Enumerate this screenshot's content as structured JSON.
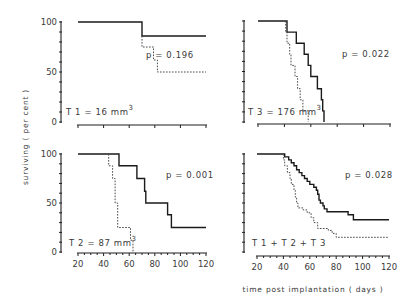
{
  "figure": {
    "ylabel": "surviving ( per cent )",
    "xlabel": "time post implantation  ( days )",
    "x_ticks": [
      "20",
      "40",
      "60",
      "80",
      "100",
      "120"
    ],
    "y_ticks": [
      "0",
      "50",
      "100"
    ]
  },
  "panels": [
    {
      "id": "t1",
      "label": "T 1 = 16 mm",
      "label_sup": "3",
      "p_value": "p = 0.196"
    },
    {
      "id": "t3",
      "label": "T 3 = 176  mm",
      "label_sup": "3",
      "p_value": "p = 0.022"
    },
    {
      "id": "t2",
      "label": "T 2 = 87 mm",
      "label_sup": "3",
      "p_value": "p = 0.001"
    },
    {
      "id": "all",
      "label": "T 1 + T 2 + T 3",
      "label_sup": "",
      "p_value": "p = 0.028"
    }
  ],
  "chart_data": [
    {
      "type": "line",
      "title": "T 1 = 16 mm3",
      "xlabel": "time post implantation (days)",
      "ylabel": "surviving (per cent)",
      "xlim": [
        20,
        120
      ],
      "ylim": [
        0,
        100
      ],
      "x_ticks": [
        20,
        40,
        60,
        80,
        100,
        120
      ],
      "y_ticks": [
        0,
        50,
        100
      ],
      "step": true,
      "annotation": "p = 0.196",
      "series": [
        {
          "name": "solid",
          "style": "solid",
          "points": [
            [
              20,
              100
            ],
            [
              70,
              100
            ],
            [
              70,
              86
            ],
            [
              120,
              86
            ]
          ]
        },
        {
          "name": "dashed",
          "style": "dashed",
          "points": [
            [
              70,
              86
            ],
            [
              70,
              75
            ],
            [
              79,
              75
            ],
            [
              79,
              62
            ],
            [
              82,
              62
            ],
            [
              82,
              50
            ],
            [
              120,
              50
            ]
          ]
        }
      ]
    },
    {
      "type": "line",
      "title": "T 3 = 176 mm3",
      "xlabel": "time post implantation (days)",
      "ylabel": "surviving (per cent)",
      "xlim": [
        20,
        120
      ],
      "ylim": [
        0,
        100
      ],
      "x_ticks": [
        20,
        40,
        60,
        80,
        100,
        120
      ],
      "y_ticks": [
        0,
        50,
        100
      ],
      "step": true,
      "annotation": "p = 0.022",
      "series": [
        {
          "name": "solid",
          "style": "solid",
          "points": [
            [
              20,
              100
            ],
            [
              42,
              100
            ],
            [
              42,
              89
            ],
            [
              49,
              89
            ],
            [
              49,
              78
            ],
            [
              55,
              78
            ],
            [
              55,
              67
            ],
            [
              58,
              67
            ],
            [
              58,
              56
            ],
            [
              60,
              56
            ],
            [
              60,
              45
            ],
            [
              65,
              45
            ],
            [
              65,
              33
            ],
            [
              68,
              33
            ],
            [
              68,
              22
            ],
            [
              69,
              22
            ],
            [
              69,
              11
            ],
            [
              70,
              11
            ],
            [
              70,
              0
            ]
          ]
        },
        {
          "name": "dashed",
          "style": "dashed",
          "points": [
            [
              41,
              100
            ],
            [
              41,
              89
            ],
            [
              42,
              89
            ],
            [
              42,
              78
            ],
            [
              44,
              78
            ],
            [
              44,
              67
            ],
            [
              45,
              67
            ],
            [
              45,
              56
            ],
            [
              48,
              56
            ],
            [
              48,
              45
            ],
            [
              50,
              45
            ],
            [
              50,
              33
            ],
            [
              52,
              33
            ],
            [
              52,
              22
            ],
            [
              54,
              22
            ],
            [
              54,
              11
            ],
            [
              58,
              11
            ],
            [
              58,
              0
            ]
          ]
        }
      ]
    },
    {
      "type": "line",
      "title": "T 2 = 87 mm3",
      "xlabel": "time post implantation (days)",
      "ylabel": "surviving (per cent)",
      "xlim": [
        20,
        120
      ],
      "ylim": [
        0,
        100
      ],
      "x_ticks": [
        20,
        40,
        60,
        80,
        100,
        120
      ],
      "y_ticks": [
        0,
        50,
        100
      ],
      "step": true,
      "annotation": "p = 0.001",
      "series": [
        {
          "name": "solid",
          "style": "solid",
          "points": [
            [
              20,
              100
            ],
            [
              52,
              100
            ],
            [
              52,
              88
            ],
            [
              66,
              88
            ],
            [
              66,
              75
            ],
            [
              72,
              75
            ],
            [
              72,
              62
            ],
            [
              73,
              62
            ],
            [
              73,
              50
            ],
            [
              90,
              50
            ],
            [
              90,
              38
            ],
            [
              93,
              38
            ],
            [
              93,
              25
            ],
            [
              120,
              25
            ]
          ]
        },
        {
          "name": "dashed",
          "style": "dashed",
          "points": [
            [
              44,
              100
            ],
            [
              44,
              88
            ],
            [
              47,
              88
            ],
            [
              47,
              75
            ],
            [
              49,
              75
            ],
            [
              49,
              50
            ],
            [
              51,
              50
            ],
            [
              51,
              25
            ],
            [
              61,
              25
            ],
            [
              61,
              12
            ],
            [
              63,
              12
            ],
            [
              63,
              0
            ]
          ]
        }
      ]
    },
    {
      "type": "line",
      "title": "T 1 + T 2 + T 3",
      "xlabel": "time post implantation (days)",
      "ylabel": "surviving (per cent)",
      "xlim": [
        20,
        120
      ],
      "ylim": [
        0,
        100
      ],
      "x_ticks": [
        20,
        40,
        60,
        80,
        100,
        120
      ],
      "y_ticks": [
        0,
        50,
        100
      ],
      "step": true,
      "annotation": "p = 0.028",
      "series": [
        {
          "name": "solid",
          "style": "solid",
          "points": [
            [
              20,
              100
            ],
            [
              41,
              100
            ],
            [
              41,
              97
            ],
            [
              44,
              97
            ],
            [
              44,
              94
            ],
            [
              46,
              94
            ],
            [
              46,
              91
            ],
            [
              48,
              91
            ],
            [
              48,
              88
            ],
            [
              50,
              88
            ],
            [
              50,
              84
            ],
            [
              52,
              84
            ],
            [
              52,
              81
            ],
            [
              54,
              81
            ],
            [
              54,
              78
            ],
            [
              56,
              78
            ],
            [
              56,
              75
            ],
            [
              58,
              75
            ],
            [
              58,
              72
            ],
            [
              60,
              72
            ],
            [
              60,
              69
            ],
            [
              63,
              69
            ],
            [
              63,
              66
            ],
            [
              65,
              66
            ],
            [
              65,
              63
            ],
            [
              66,
              63
            ],
            [
              66,
              59
            ],
            [
              67,
              59
            ],
            [
              67,
              53
            ],
            [
              68,
              53
            ],
            [
              68,
              50
            ],
            [
              70,
              50
            ],
            [
              70,
              47
            ],
            [
              71,
              47
            ],
            [
              71,
              44
            ],
            [
              73,
              44
            ],
            [
              73,
              41
            ],
            [
              89,
              41
            ],
            [
              89,
              38
            ],
            [
              93,
              38
            ],
            [
              93,
              33
            ],
            [
              120,
              33
            ]
          ]
        },
        {
          "name": "dashed",
          "style": "dashed",
          "points": [
            [
              40,
              100
            ],
            [
              40,
              94
            ],
            [
              41,
              94
            ],
            [
              41,
              88
            ],
            [
              43,
              88
            ],
            [
              43,
              81
            ],
            [
              45,
              81
            ],
            [
              45,
              75
            ],
            [
              46,
              75
            ],
            [
              46,
              69
            ],
            [
              48,
              69
            ],
            [
              48,
              63
            ],
            [
              49,
              63
            ],
            [
              49,
              56
            ],
            [
              50,
              56
            ],
            [
              50,
              50
            ],
            [
              51,
              50
            ],
            [
              51,
              45
            ],
            [
              55,
              45
            ],
            [
              55,
              43
            ],
            [
              58,
              43
            ],
            [
              58,
              40
            ],
            [
              61,
              40
            ],
            [
              61,
              35
            ],
            [
              63,
              35
            ],
            [
              63,
              30
            ],
            [
              66,
              30
            ],
            [
              66,
              24
            ],
            [
              74,
              24
            ],
            [
              74,
              22
            ],
            [
              77,
              22
            ],
            [
              77,
              19
            ],
            [
              80,
              19
            ],
            [
              80,
              15
            ],
            [
              120,
              15
            ]
          ]
        }
      ]
    }
  ]
}
